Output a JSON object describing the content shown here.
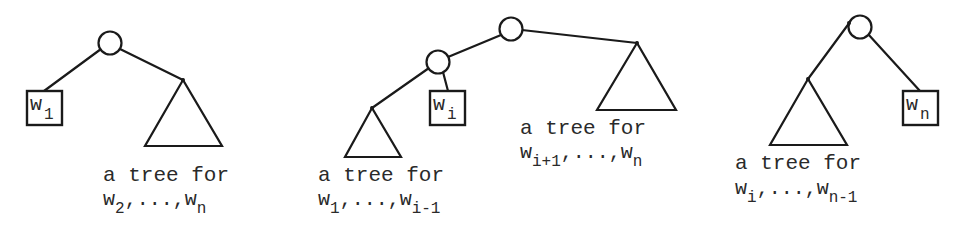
{
  "diagram": {
    "trees": [
      {
        "id": "tree-1",
        "leaf": {
          "base": "w",
          "sub": "1"
        },
        "subtree": {
          "caption": "a tree for",
          "range": {
            "start_base": "w",
            "start_sub": "2",
            "sep": ",...,",
            "end_base": "w",
            "end_sub": "n"
          }
        }
      },
      {
        "id": "tree-2",
        "leaf": {
          "base": "w",
          "sub": "i"
        },
        "left_subtree": {
          "caption": "a tree for",
          "range": {
            "start_base": "w",
            "start_sub": "1",
            "sep": ",...,",
            "end_base": "w",
            "end_sub": "i-1"
          }
        },
        "right_subtree": {
          "caption": "a tree for",
          "range": {
            "start_base": "w",
            "start_sub": "i+1",
            "sep": ",...,",
            "end_base": "w",
            "end_sub": "n"
          }
        }
      },
      {
        "id": "tree-3",
        "leaf": {
          "base": "w",
          "sub": "n"
        },
        "subtree": {
          "caption": "a tree for",
          "range": {
            "start_base": "w",
            "start_sub": "i",
            "sep": ",...,",
            "end_base": "w",
            "end_sub": "n-1"
          }
        }
      }
    ],
    "colors": {
      "ink": "#1a1a1a",
      "background": "#ffffff"
    }
  }
}
